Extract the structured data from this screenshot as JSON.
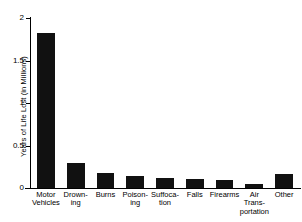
{
  "chart_data": {
    "type": "bar",
    "title": "",
    "xlabel": "",
    "ylabel": "Years of Life Lost (in Millions)",
    "ylim": [
      0,
      2
    ],
    "yticks": [
      0,
      0.5,
      1,
      1.5,
      2
    ],
    "ytick_labels": [
      "0",
      "0.5",
      "1",
      "1.5",
      "2"
    ],
    "grid": false,
    "legend": "none",
    "bar_color": "#111111",
    "axis_color": "#000000",
    "background": "#ffffff",
    "categories": [
      "Motor\nVehicles",
      "Drown-\ning",
      "Burns",
      "Poison-\ning",
      "Suffoca-\ntion",
      "Falls",
      "Firearms",
      "Air\nTrans-\nportation",
      "Other"
    ],
    "category_plain": [
      "Motor Vehicles",
      "Drowning",
      "Burns",
      "Poisoning",
      "Suffocation",
      "Falls",
      "Firearms",
      "Air Transportation",
      "Other"
    ],
    "values": [
      1.82,
      0.3,
      0.18,
      0.14,
      0.12,
      0.11,
      0.1,
      0.05,
      0.16
    ]
  }
}
